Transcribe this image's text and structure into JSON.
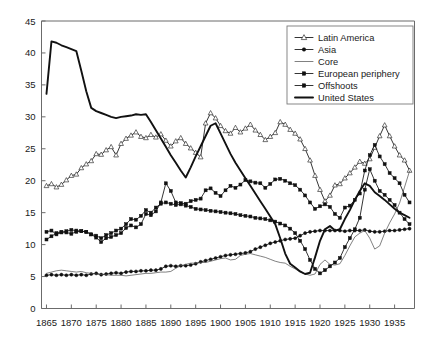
{
  "chart_data": {
    "type": "line",
    "title": "",
    "subtitle": "",
    "xlabel": "",
    "ylabel": "",
    "xlim": [
      1864,
      1939
    ],
    "ylim": [
      0,
      45
    ],
    "yticks": [
      0,
      5,
      10,
      15,
      20,
      25,
      30,
      35,
      40,
      45
    ],
    "xticks": [
      1865,
      1870,
      1875,
      1880,
      1885,
      1890,
      1895,
      1900,
      1905,
      1910,
      1915,
      1920,
      1925,
      1930,
      1935
    ],
    "grid": false,
    "legend_position": "top-right",
    "x": [
      1865,
      1866,
      1867,
      1868,
      1869,
      1870,
      1871,
      1872,
      1873,
      1874,
      1875,
      1876,
      1877,
      1878,
      1879,
      1880,
      1881,
      1882,
      1883,
      1884,
      1885,
      1886,
      1887,
      1888,
      1889,
      1890,
      1891,
      1892,
      1893,
      1894,
      1895,
      1896,
      1897,
      1898,
      1899,
      1900,
      1901,
      1902,
      1903,
      1904,
      1905,
      1906,
      1907,
      1908,
      1909,
      1910,
      1911,
      1912,
      1913,
      1914,
      1915,
      1916,
      1917,
      1918,
      1919,
      1920,
      1921,
      1922,
      1923,
      1924,
      1925,
      1926,
      1927,
      1928,
      1929,
      1930,
      1931,
      1932,
      1933,
      1934,
      1935,
      1936,
      1937,
      1938
    ],
    "series": [
      {
        "name": "Latin America",
        "marker": "open-triangle",
        "values": [
          19.2,
          19.5,
          19.0,
          19.4,
          20.1,
          20.8,
          21.0,
          22.0,
          22.6,
          23.1,
          24.2,
          24.1,
          24.8,
          25.3,
          24.0,
          25.8,
          26.6,
          27.1,
          27.6,
          26.9,
          26.7,
          27.2,
          26.8,
          27.3,
          26.3,
          25.4,
          26.2,
          26.7,
          25.8,
          25.1,
          24.4,
          23.7,
          29.0,
          30.6,
          29.8,
          28.6,
          27.8,
          27.4,
          28.3,
          27.6,
          28.2,
          28.8,
          27.9,
          27.2,
          26.4,
          26.9,
          27.5,
          29.2,
          28.8,
          28.0,
          27.4,
          26.5,
          25.0,
          23.2,
          20.8,
          18.6,
          16.8,
          17.7,
          19.3,
          19.5,
          20.4,
          21.2,
          22.1,
          23.0,
          22.7,
          23.4,
          25.2,
          27.0,
          28.7,
          27.0,
          25.4,
          24.0,
          23.2,
          21.6
        ]
      },
      {
        "name": "Asia",
        "marker": "filled-circle",
        "values": [
          5.2,
          5.3,
          5.2,
          5.3,
          5.2,
          5.3,
          5.2,
          5.3,
          5.2,
          5.4,
          5.5,
          5.3,
          5.4,
          5.5,
          5.6,
          5.5,
          5.7,
          5.8,
          5.8,
          5.9,
          5.9,
          6.0,
          6.0,
          6.2,
          6.6,
          6.7,
          6.6,
          6.7,
          6.7,
          6.8,
          7.0,
          7.3,
          7.5,
          7.7,
          7.9,
          8.1,
          8.3,
          8.4,
          8.5,
          8.6,
          8.7,
          8.9,
          9.3,
          9.6,
          9.9,
          10.2,
          10.4,
          10.6,
          10.8,
          10.9,
          11.0,
          11.4,
          11.8,
          12.0,
          12.1,
          12.2,
          12.2,
          12.2,
          12.2,
          12.2,
          12.1,
          12.2,
          12.2,
          12.2,
          12.3,
          12.1,
          12.0,
          12.0,
          12.1,
          12.2,
          12.2,
          12.3,
          12.4,
          12.5
        ]
      },
      {
        "name": "Core",
        "marker": "none",
        "values": [
          5.5,
          5.7,
          5.9,
          6.0,
          5.9,
          5.8,
          5.7,
          5.8,
          5.6,
          5.5,
          5.4,
          5.3,
          5.3,
          5.2,
          5.2,
          5.2,
          5.1,
          5.2,
          5.3,
          5.4,
          5.5,
          5.5,
          5.6,
          5.7,
          5.7,
          5.8,
          6.3,
          6.7,
          6.9,
          7.1,
          7.1,
          7.2,
          7.2,
          7.4,
          7.6,
          7.8,
          7.9,
          7.6,
          7.7,
          8.3,
          8.5,
          8.6,
          8.4,
          8.2,
          8.0,
          7.7,
          7.4,
          7.2,
          7.1,
          6.6,
          6.2,
          5.7,
          5.4,
          5.2,
          5.4,
          6.9,
          7.6,
          6.9,
          6.8,
          7.0,
          8.3,
          9.8,
          11.2,
          11.8,
          12.2,
          11.0,
          9.3,
          9.8,
          11.8,
          13.4,
          14.8,
          16.5,
          19.0,
          21.5
        ]
      },
      {
        "name": "European periphery",
        "marker": "filled-square",
        "values": [
          10.8,
          11.3,
          11.8,
          12.0,
          11.9,
          11.7,
          12.0,
          12.1,
          12.0,
          11.6,
          11.1,
          10.4,
          11.0,
          11.2,
          11.5,
          11.8,
          12.6,
          13.0,
          12.7,
          13.2,
          14.8,
          14.6,
          15.2,
          16.6,
          19.6,
          18.4,
          16.6,
          16.5,
          16.4,
          16.8,
          17.0,
          17.2,
          18.5,
          18.8,
          18.1,
          17.6,
          18.5,
          19.2,
          18.9,
          19.4,
          20.1,
          19.9,
          19.7,
          19.6,
          18.9,
          19.5,
          20.2,
          20.3,
          20.0,
          19.6,
          19.3,
          18.6,
          17.7,
          16.6,
          15.6,
          16.0,
          16.3,
          15.9,
          14.8,
          14.2,
          15.8,
          16.1,
          17.0,
          18.0,
          21.6,
          24.0,
          25.6,
          23.8,
          22.6,
          21.2,
          20.4,
          19.6,
          17.8,
          16.6
        ]
      },
      {
        "name": "Offshoots",
        "marker": "filled-square",
        "values": [
          12.0,
          12.2,
          11.6,
          11.9,
          12.1,
          12.3,
          12.2,
          12.1,
          12.0,
          11.6,
          11.4,
          11.0,
          11.5,
          11.8,
          12.2,
          12.5,
          13.2,
          14.0,
          13.9,
          14.5,
          15.4,
          15.0,
          15.8,
          16.4,
          16.6,
          16.4,
          16.2,
          16.3,
          16.1,
          15.9,
          15.6,
          15.5,
          15.4,
          15.3,
          15.2,
          15.1,
          15.0,
          14.9,
          14.8,
          14.6,
          14.5,
          14.4,
          14.2,
          14.1,
          14.0,
          13.8,
          13.6,
          13.3,
          13.0,
          12.5,
          11.8,
          10.6,
          9.3,
          7.6,
          6.2,
          5.5,
          6.0,
          6.6,
          7.2,
          7.9,
          9.6,
          11.0,
          12.4,
          14.2,
          18.6,
          21.8,
          20.0,
          18.4,
          17.8,
          17.0,
          16.2,
          15.0,
          14.0,
          13.2
        ]
      },
      {
        "name": "United States",
        "marker": "none",
        "values": [
          33.6,
          41.8,
          41.6,
          41.2,
          40.9,
          40.6,
          40.3,
          37.2,
          34.0,
          31.4,
          30.9,
          30.6,
          30.3,
          30.0,
          29.8,
          30.0,
          30.1,
          30.2,
          30.4,
          30.3,
          30.4,
          29.2,
          27.9,
          26.6,
          25.3,
          24.0,
          22.8,
          21.6,
          20.5,
          22.1,
          23.8,
          25.4,
          27.0,
          28.6,
          29.0,
          27.4,
          25.8,
          24.2,
          22.8,
          21.6,
          20.4,
          19.2,
          18.0,
          16.8,
          15.6,
          14.4,
          13.2,
          11.0,
          8.6,
          7.0,
          6.4,
          5.8,
          5.4,
          5.6,
          8.0,
          10.6,
          12.4,
          12.9,
          12.2,
          12.4,
          14.0,
          15.4,
          17.0,
          18.4,
          19.6,
          19.2,
          18.2,
          17.6,
          17.0,
          16.3,
          15.6,
          15.0,
          14.6,
          14.2
        ]
      }
    ]
  },
  "legend": {
    "items": [
      {
        "label": "Latin America",
        "marker": "open-triangle"
      },
      {
        "label": "Asia",
        "marker": "filled-circle"
      },
      {
        "label": "Core",
        "marker": "none"
      },
      {
        "label": "European periphery",
        "marker": "filled-square"
      },
      {
        "label": "Offshoots",
        "marker": "filled-square"
      },
      {
        "label": "United States",
        "marker": "thick-line"
      }
    ]
  },
  "axes": {
    "y_tick_labels": [
      "0",
      "5",
      "10",
      "15",
      "20",
      "25",
      "30",
      "35",
      "40",
      "45"
    ],
    "x_tick_labels": [
      "1865",
      "1870",
      "1875",
      "1880",
      "1885",
      "1890",
      "1895",
      "1900",
      "1905",
      "1910",
      "1915",
      "1920",
      "1925",
      "1930",
      "1935"
    ]
  },
  "colors": {
    "line": "#111111",
    "axis": "#6b6b6b",
    "background": "#ffffff"
  }
}
